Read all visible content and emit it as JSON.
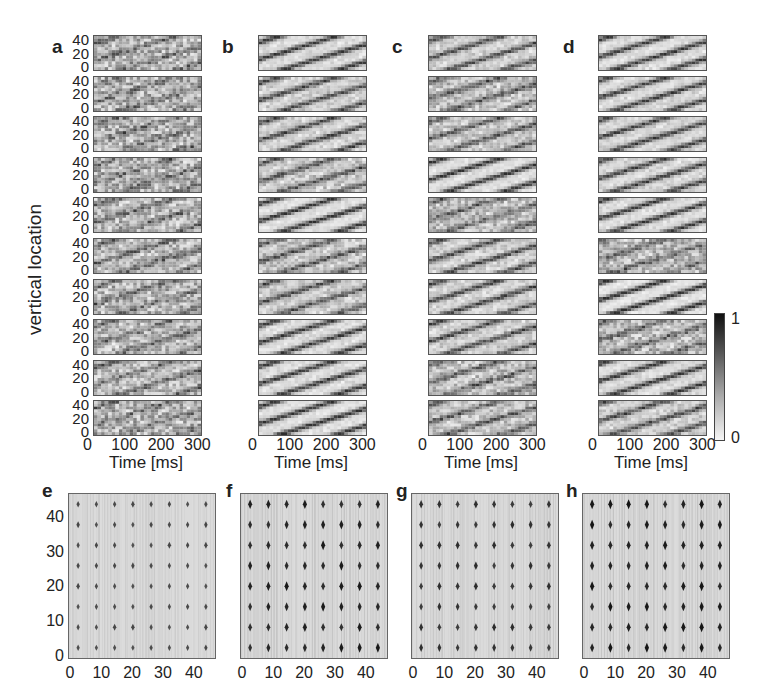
{
  "panels_top": {
    "labels": [
      "a",
      "b",
      "c",
      "d"
    ],
    "ylabel": "vertical location",
    "xlabel": "Time [ms]",
    "yticks": [
      "40",
      "20",
      "0"
    ],
    "xticks": [
      "0",
      "100",
      "200",
      "300"
    ]
  },
  "colorbar": {
    "max_label": "1",
    "min_label": "0"
  },
  "panels_bottom": {
    "labels": [
      "e",
      "f",
      "g",
      "h"
    ],
    "yticks": [
      "40",
      "30",
      "20",
      "10",
      "0"
    ],
    "xticks": [
      "0",
      "10",
      "20",
      "30",
      "40"
    ]
  },
  "chart_data": [
    {
      "type": "heatmap",
      "panel": "a",
      "title": "",
      "xlabel": "Time [ms]",
      "ylabel": "vertical location",
      "xlim": [
        0,
        300
      ],
      "ylim": [
        0,
        48
      ],
      "xticks": [
        0,
        100,
        200,
        300
      ],
      "yticks": [
        0,
        20,
        40
      ],
      "rows": 10,
      "description": "Noisy, weak diagonal stripes (low contrast)",
      "stripe_contrast": [
        0.35,
        0.3,
        0.3,
        0.3,
        0.4,
        0.45,
        0.35,
        0.4,
        0.45,
        0.3
      ]
    },
    {
      "type": "heatmap",
      "panel": "b",
      "xlabel": "Time [ms]",
      "xlim": [
        0,
        300
      ],
      "ylim": [
        0,
        48
      ],
      "xticks": [
        0,
        100,
        200,
        300
      ],
      "rows": 10,
      "description": "Clear diagonal travelling-wave stripes",
      "stripe_contrast": [
        0.85,
        0.7,
        0.75,
        0.6,
        0.9,
        0.55,
        0.65,
        0.85,
        0.85,
        0.9
      ]
    },
    {
      "type": "heatmap",
      "panel": "c",
      "xlabel": "Time [ms]",
      "xlim": [
        0,
        300
      ],
      "ylim": [
        0,
        48
      ],
      "xticks": [
        0,
        100,
        200,
        300
      ],
      "rows": 10,
      "description": "Mixed clear and noisy diagonal stripes",
      "stripe_contrast": [
        0.7,
        0.5,
        0.6,
        0.9,
        0.45,
        0.7,
        0.75,
        0.7,
        0.5,
        0.55
      ]
    },
    {
      "type": "heatmap",
      "panel": "d",
      "xlabel": "Time [ms]",
      "xlim": [
        0,
        300
      ],
      "ylim": [
        0,
        48
      ],
      "xticks": [
        0,
        100,
        200,
        300
      ],
      "rows": 10,
      "description": "Clear diagonal travelling-wave stripes",
      "stripe_contrast": [
        0.85,
        0.8,
        0.8,
        0.8,
        0.85,
        0.4,
        0.95,
        0.45,
        0.85,
        0.7
      ]
    },
    {
      "type": "scatter",
      "panel": "e",
      "xlim": [
        0,
        48
      ],
      "ylim": [
        0,
        48
      ],
      "xticks": [
        0,
        10,
        20,
        30,
        40
      ],
      "yticks": [
        0,
        10,
        20,
        30,
        40
      ],
      "grid_x": [
        3,
        9,
        15,
        21,
        27,
        33,
        39,
        45
      ],
      "grid_y": [
        3,
        9,
        15,
        21,
        27,
        33,
        39,
        45
      ],
      "marker_strength": 0.45
    },
    {
      "type": "scatter",
      "panel": "f",
      "xlim": [
        0,
        48
      ],
      "ylim": [
        0,
        48
      ],
      "xticks": [
        0,
        10,
        20,
        30,
        40
      ],
      "grid_x": [
        3,
        9,
        15,
        21,
        27,
        33,
        39,
        45
      ],
      "grid_y": [
        3,
        9,
        15,
        21,
        27,
        33,
        39,
        45
      ],
      "marker_strength": 0.95
    },
    {
      "type": "scatter",
      "panel": "g",
      "xlim": [
        0,
        48
      ],
      "ylim": [
        0,
        48
      ],
      "xticks": [
        0,
        10,
        20,
        30,
        40
      ],
      "grid_x": [
        3,
        9,
        15,
        21,
        27,
        33,
        39,
        45
      ],
      "grid_y": [
        3,
        9,
        15,
        21,
        27,
        33,
        39,
        45
      ],
      "marker_strength": 0.75
    },
    {
      "type": "scatter",
      "panel": "h",
      "xlim": [
        0,
        48
      ],
      "ylim": [
        0,
        48
      ],
      "xticks": [
        0,
        10,
        20,
        30,
        40
      ],
      "grid_x": [
        3,
        9,
        15,
        21,
        27,
        33,
        39,
        45
      ],
      "grid_y": [
        3,
        9,
        15,
        21,
        27,
        33,
        39,
        45
      ],
      "marker_strength": 1.0
    }
  ]
}
